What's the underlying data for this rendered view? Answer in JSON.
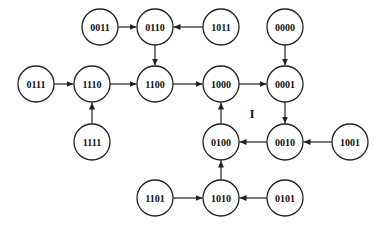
{
  "diagram": {
    "type": "state-transition-graph",
    "node_radius": 18,
    "nodes": [
      {
        "id": "0011",
        "label": "0011",
        "x": 100,
        "y": 27
      },
      {
        "id": "0110",
        "label": "0110",
        "x": 155,
        "y": 27
      },
      {
        "id": "1011",
        "label": "1011",
        "x": 221,
        "y": 27
      },
      {
        "id": "0000",
        "label": "0000",
        "x": 285,
        "y": 27
      },
      {
        "id": "0111",
        "label": "0111",
        "x": 36,
        "y": 84
      },
      {
        "id": "1110",
        "label": "1110",
        "x": 92,
        "y": 84
      },
      {
        "id": "1100",
        "label": "1100",
        "x": 155,
        "y": 84
      },
      {
        "id": "1000",
        "label": "1000",
        "x": 221,
        "y": 84
      },
      {
        "id": "0001",
        "label": "0001",
        "x": 285,
        "y": 84
      },
      {
        "id": "1111",
        "label": "1111",
        "x": 92,
        "y": 142
      },
      {
        "id": "0100",
        "label": "0100",
        "x": 221,
        "y": 142
      },
      {
        "id": "0010",
        "label": "0010",
        "x": 285,
        "y": 142
      },
      {
        "id": "1001",
        "label": "1001",
        "x": 350,
        "y": 142
      },
      {
        "id": "1101",
        "label": "1101",
        "x": 155,
        "y": 198
      },
      {
        "id": "1010",
        "label": "1010",
        "x": 221,
        "y": 198
      },
      {
        "id": "0101",
        "label": "0101",
        "x": 285,
        "y": 198
      }
    ],
    "edges": [
      {
        "from": "0011",
        "to": "0110"
      },
      {
        "from": "1011",
        "to": "0110"
      },
      {
        "from": "0110",
        "to": "1100"
      },
      {
        "from": "0111",
        "to": "1110"
      },
      {
        "from": "1111",
        "to": "1110"
      },
      {
        "from": "1110",
        "to": "1100"
      },
      {
        "from": "1100",
        "to": "1000"
      },
      {
        "from": "1000",
        "to": "0001"
      },
      {
        "from": "0000",
        "to": "0001"
      },
      {
        "from": "0001",
        "to": "0010"
      },
      {
        "from": "1001",
        "to": "0010"
      },
      {
        "from": "0010",
        "to": "0100"
      },
      {
        "from": "0100",
        "to": "1000"
      },
      {
        "from": "1010",
        "to": "0100"
      },
      {
        "from": "1101",
        "to": "1010"
      },
      {
        "from": "0101",
        "to": "1010"
      }
    ],
    "annotations": [
      {
        "text": "I",
        "x": 252,
        "y": 118
      }
    ],
    "colors": {
      "stroke": "#222222",
      "fill": "#ffffff",
      "text": "#111111"
    }
  }
}
